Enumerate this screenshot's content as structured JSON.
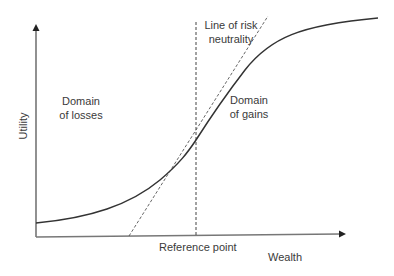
{
  "diagram": {
    "type": "prospect-theory-utility-curve",
    "y_axis_label": "Utility",
    "x_axis_label": "Wealth",
    "reference_label": "Reference point",
    "risk_neutral_label_line1": "Line of risk",
    "risk_neutral_label_line2": "neutrality",
    "losses_label_line1": "Domain",
    "losses_label_line2": "of losses",
    "gains_label_line1": "Domain",
    "gains_label_line2": "of gains",
    "colors": {
      "curve": "#333333",
      "axis": "#555555",
      "dashed": "#444444",
      "text": "#3a3a3a"
    }
  }
}
